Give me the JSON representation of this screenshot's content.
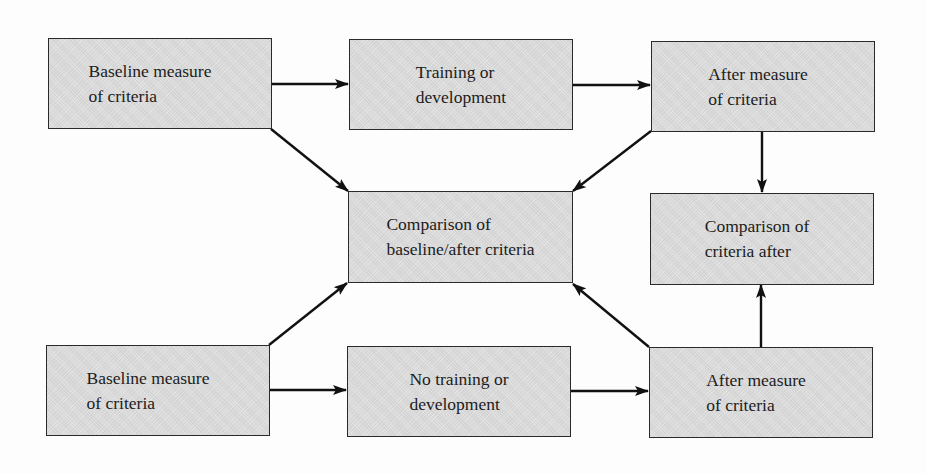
{
  "diagram": {
    "type": "flowchart",
    "colors": {
      "box_fill": "#dedede",
      "box_border": "#2a2a2a",
      "arrow": "#111111",
      "text": "#1c1c1c",
      "background": "#fdfdfd"
    },
    "nodes": {
      "top_baseline": {
        "line1": "Baseline measure",
        "line2": "of criteria"
      },
      "top_training": {
        "line1": "Training or",
        "line2": "development"
      },
      "top_after": {
        "line1": "After measure",
        "line2": "of criteria"
      },
      "comparison_baseline_after": {
        "line1": "Comparison of",
        "line2": "baseline/after criteria"
      },
      "comparison_after": {
        "line1": "Comparison of",
        "line2": "criteria after"
      },
      "bottom_baseline": {
        "line1": "Baseline measure",
        "line2": "of criteria"
      },
      "bottom_no_training": {
        "line1": "No training or",
        "line2": "development"
      },
      "bottom_after": {
        "line1": "After measure",
        "line2": "of criteria"
      }
    },
    "edges": [
      {
        "from": "top_baseline",
        "to": "top_training"
      },
      {
        "from": "top_training",
        "to": "top_after"
      },
      {
        "from": "top_baseline",
        "to": "comparison_baseline_after"
      },
      {
        "from": "top_after",
        "to": "comparison_baseline_after"
      },
      {
        "from": "top_after",
        "to": "comparison_after"
      },
      {
        "from": "bottom_baseline",
        "to": "bottom_no_training"
      },
      {
        "from": "bottom_no_training",
        "to": "bottom_after"
      },
      {
        "from": "bottom_baseline",
        "to": "comparison_baseline_after"
      },
      {
        "from": "bottom_after",
        "to": "comparison_baseline_after"
      },
      {
        "from": "bottom_after",
        "to": "comparison_after"
      }
    ]
  }
}
